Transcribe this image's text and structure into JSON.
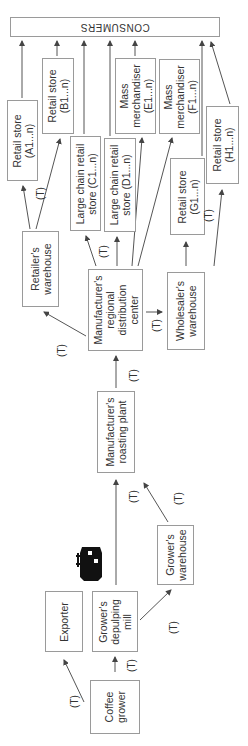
{
  "diagram": {
    "consumers": "CONSUMERS",
    "nodes": {
      "retail_a": [
        "Retail store",
        "(A1...n)"
      ],
      "retail_b": [
        "Retail store",
        "(B1...n)"
      ],
      "chain_c": [
        "Large chain retail",
        "store (C1...n)"
      ],
      "chain_d": [
        "Large chain retail",
        "store (D1...n)"
      ],
      "mass_e": [
        "Mass",
        "merchandiser",
        "(E1...n)"
      ],
      "mass_f": [
        "Mass",
        "merchandiser",
        "(F1...n)"
      ],
      "retail_g": [
        "Retail store",
        "(G1...n)"
      ],
      "retail_h": [
        "Retail store",
        "(H1...n)"
      ],
      "retailer_wh": [
        "Retailer's",
        "warehouse"
      ],
      "mfr_dc": [
        "Manufacturer's",
        "regional",
        "distribution",
        "center"
      ],
      "wholesaler_wh": [
        "Wholesaler's",
        "warehouse"
      ],
      "roasting": [
        "Manufacturer's",
        "roasting plant"
      ],
      "exporter": [
        "Exporter"
      ],
      "depulping": [
        "Grower's",
        "depulping",
        "mill"
      ],
      "grower_wh": [
        "Grower's",
        "warehouse"
      ],
      "coffee_grower": [
        "Coffee",
        "grower"
      ]
    },
    "transport_label": "(T)",
    "icons": [
      "ship-icon"
    ],
    "colors": {
      "line": "#555555",
      "border": "#9a9a9a",
      "text": "#333333"
    }
  }
}
